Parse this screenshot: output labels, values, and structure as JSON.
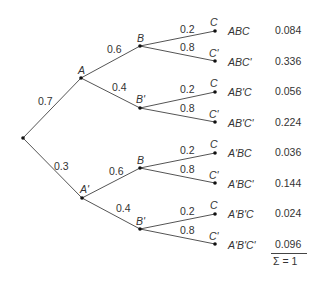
{
  "diagram": {
    "type": "probability-tree",
    "root": {
      "children": [
        {
          "node_label": "A",
          "edge_prob": "0.7",
          "children": [
            {
              "node_label": "B",
              "edge_prob": "0.6",
              "children": [
                {
                  "node_label": "C",
                  "edge_prob": "0.2",
                  "outcome": "ABC",
                  "value": "0.084"
                },
                {
                  "node_label": "C'",
                  "edge_prob": "0.8",
                  "outcome": "ABC'",
                  "value": "0.336"
                }
              ]
            },
            {
              "node_label": "B'",
              "edge_prob": "0.4",
              "children": [
                {
                  "node_label": "C",
                  "edge_prob": "0.2",
                  "outcome": "AB'C",
                  "value": "0.056"
                },
                {
                  "node_label": "C'",
                  "edge_prob": "0.8",
                  "outcome": "AB'C'",
                  "value": "0.224"
                }
              ]
            }
          ]
        },
        {
          "node_label": "A'",
          "edge_prob": "0.3",
          "children": [
            {
              "node_label": "B",
              "edge_prob": "0.6",
              "children": [
                {
                  "node_label": "C",
                  "edge_prob": "0.2",
                  "outcome": "A'BC",
                  "value": "0.036"
                },
                {
                  "node_label": "C'",
                  "edge_prob": "0.8",
                  "outcome": "A'BC'",
                  "value": "0.144"
                }
              ]
            },
            {
              "node_label": "B'",
              "edge_prob": "0.4",
              "children": [
                {
                  "node_label": "C",
                  "edge_prob": "0.2",
                  "outcome": "A'B'C",
                  "value": "0.024"
                },
                {
                  "node_label": "C'",
                  "edge_prob": "0.8",
                  "outcome": "A'B'C'",
                  "value": "0.096"
                }
              ]
            }
          ]
        }
      ]
    },
    "sum_label": "Σ = 1"
  }
}
